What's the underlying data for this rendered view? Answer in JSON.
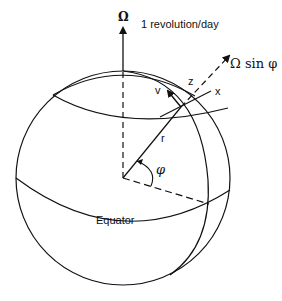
{
  "figure": {
    "type": "earth-rotation-diagram",
    "labels": {
      "omega": "Ω",
      "rotation_rate": "1 revolution/day",
      "omega_sin_phi": "Ω sin φ",
      "z_axis": "z",
      "x_axis": "x",
      "v_vector": "v",
      "radius": "r",
      "latitude_angle": "φ",
      "equator": "Equator"
    },
    "colors": {
      "line": "#111111",
      "background": "#ffffff"
    }
  }
}
